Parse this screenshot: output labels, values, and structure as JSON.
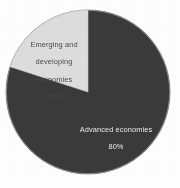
{
  "chart_data": {
    "type": "pie",
    "title": "",
    "subtitle": "",
    "xlabel": "",
    "ylabel": "",
    "grid": false,
    "legend_position": "none",
    "labels_inside_slices": true,
    "start_angle_deg": 0,
    "direction": "counterclockwise",
    "categories": [
      "Advanced economies",
      "Emerging and developing economies"
    ],
    "values": [
      80,
      20
    ],
    "value_unit": "%",
    "slices": [
      {
        "name": "Advanced economies",
        "value": 80,
        "value_label": "80%",
        "label_line1": "Advanced economies",
        "label_line2": "80%",
        "color": "#3b3a3a",
        "text_color": "#eceaea"
      },
      {
        "name": "Emerging and developing economies",
        "value": 20,
        "value_label": "20%",
        "label_line1": "Emerging and",
        "label_line2": "developing",
        "label_line3": "economies",
        "label_line4": "20%",
        "color": "#dedddd",
        "text_color": "#4a4a4a"
      }
    ]
  },
  "figure": {
    "background_color": "#fefefe",
    "pie": {
      "center_x": 88,
      "center_y": 92,
      "radius": 82,
      "outline_color": "#bdbdbd"
    }
  }
}
